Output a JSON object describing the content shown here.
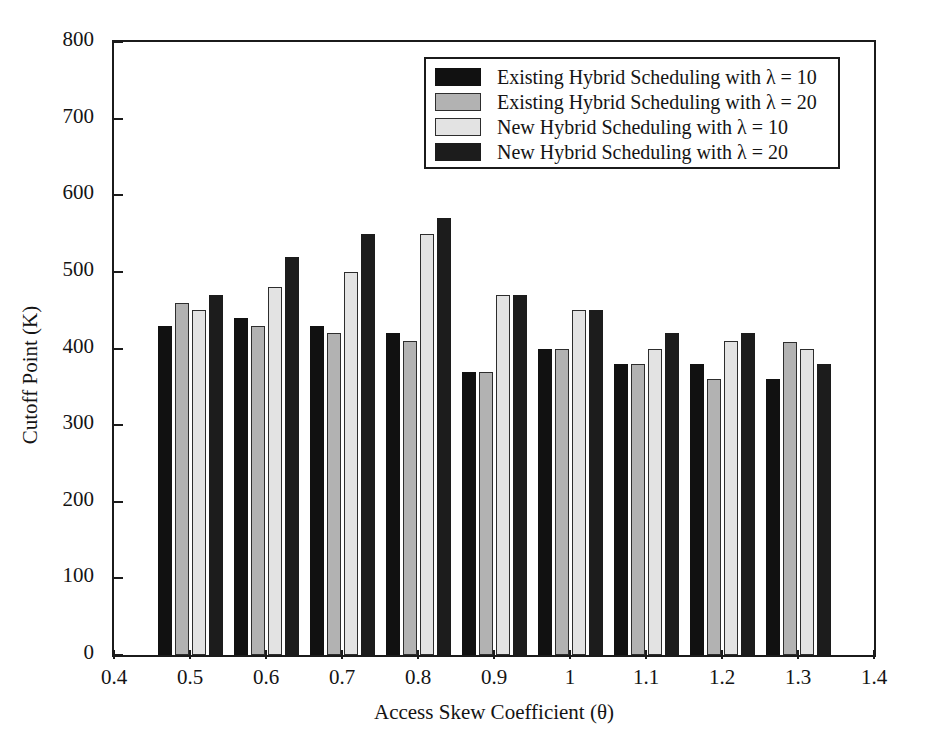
{
  "chart_data": {
    "type": "bar",
    "title": "",
    "xlabel": "Access Skew Coefficient (θ)",
    "ylabel": "Cutoff Point (K)",
    "xlim": [
      0.4,
      1.4
    ],
    "ylim": [
      0,
      800
    ],
    "xticks": [
      "0.4",
      "0.5",
      "0.6",
      "0.7",
      "0.8",
      "0.9",
      "1",
      "1.1",
      "1.2",
      "1.3",
      "1.4"
    ],
    "yticks": [
      "0",
      "100",
      "200",
      "300",
      "400",
      "500",
      "600",
      "700",
      "800"
    ],
    "grid": false,
    "legend_position": "top-center",
    "categories": [
      "0.5",
      "0.6",
      "0.7",
      "0.8",
      "0.9",
      "1",
      "1.1",
      "1.2",
      "1.3"
    ],
    "series": [
      {
        "name": "Existing Hybrid Scheduling with λ = 10",
        "color": "#111111",
        "values": [
          430,
          440,
          430,
          420,
          370,
          400,
          380,
          380,
          360
        ]
      },
      {
        "name": "Existing Hybrid Scheduling with λ = 20",
        "color": "#b2b2b2",
        "values": [
          460,
          430,
          420,
          410,
          370,
          400,
          380,
          360,
          408
        ]
      },
      {
        "name": "New Hybrid Scheduling with λ = 10",
        "color": "#e3e3e3",
        "values": [
          450,
          480,
          500,
          550,
          470,
          450,
          400,
          410,
          400
        ]
      },
      {
        "name": "New Hybrid Scheduling with λ = 20",
        "color": "#1c1c1c",
        "values": [
          470,
          520,
          550,
          570,
          470,
          450,
          420,
          420,
          380
        ]
      }
    ]
  }
}
